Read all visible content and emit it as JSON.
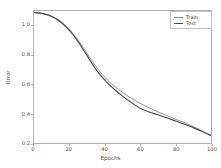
{
  "chart_data": {
    "type": "line",
    "title": "",
    "xlabel": "Epochs",
    "ylabel": "Error",
    "xlim": [
      0,
      100
    ],
    "ylim": [
      0.2,
      1.1
    ],
    "grid": false,
    "legend_position": "upper right",
    "xticks": [
      "0",
      "20",
      "40",
      "60",
      "80",
      "100"
    ],
    "xtick_values": [
      0,
      20,
      40,
      60,
      80,
      100
    ],
    "yticks": [
      "0.2",
      "0.4",
      "0.6",
      "0.8",
      "1.0"
    ],
    "ytick_values": [
      0.2,
      0.4,
      0.6,
      0.8,
      1.0
    ],
    "x": [
      0,
      5,
      10,
      15,
      20,
      25,
      30,
      35,
      40,
      45,
      50,
      55,
      60,
      65,
      70,
      75,
      80,
      85,
      90,
      95,
      100
    ],
    "series": [
      {
        "name": "Train",
        "color": "#8c8c8c",
        "values": [
          1.09,
          1.083,
          1.065,
          1.03,
          0.975,
          0.9,
          0.81,
          0.72,
          0.648,
          0.592,
          0.545,
          0.505,
          0.47,
          0.44,
          0.412,
          0.388,
          0.362,
          0.338,
          0.312,
          0.282,
          0.252
        ]
      },
      {
        "name": "Test",
        "color": "#4a4a4a",
        "values": [
          1.09,
          1.082,
          1.062,
          1.025,
          0.968,
          0.89,
          0.796,
          0.702,
          0.628,
          0.57,
          0.52,
          0.476,
          0.437,
          0.412,
          0.392,
          0.372,
          0.35,
          0.328,
          0.305,
          0.278,
          0.25
        ]
      }
    ]
  },
  "legend": {
    "entries": [
      {
        "label": "Train"
      },
      {
        "label": "Test"
      }
    ]
  }
}
